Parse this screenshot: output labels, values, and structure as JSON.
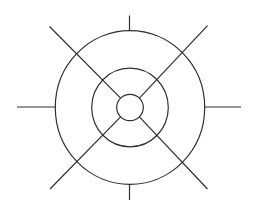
{
  "diagram": {
    "type": "concentric-target",
    "background": "#ffffff",
    "stroke_color": "#2f2f2f",
    "center": {
      "x": 130,
      "y": 107.5
    },
    "rings": [
      {
        "name": "inner",
        "rx": 13.3,
        "ry": 13.2
      },
      {
        "name": "middle",
        "rx": 38.3,
        "ry": 39.3
      },
      {
        "name": "outer",
        "rx": 74.7,
        "ry": 76.8
      }
    ],
    "cardinal_ticks": [
      {
        "name": "top",
        "x1": 129.5,
        "y1": 15.5,
        "x2": 129.5,
        "y2": 30.8
      },
      {
        "name": "bottom",
        "x1": 129.5,
        "y1": 184.3,
        "x2": 129.5,
        "y2": 200
      },
      {
        "name": "left",
        "x1": 17,
        "y1": 107,
        "x2": 55.2,
        "y2": 107
      },
      {
        "name": "right",
        "x1": 204.5,
        "y1": 107,
        "x2": 241,
        "y2": 107
      }
    ],
    "diagonals": [
      {
        "name": "top-left",
        "x1": 49.5,
        "y1": 26.5,
        "x2": 120.6,
        "y2": 98.2
      },
      {
        "name": "top-right",
        "x1": 207.5,
        "y1": 25.7,
        "x2": 139.4,
        "y2": 98.2
      },
      {
        "name": "bottom-left",
        "x1": 50,
        "y1": 189,
        "x2": 120.6,
        "y2": 116.8
      },
      {
        "name": "bottom-right",
        "x1": 207.5,
        "y1": 189,
        "x2": 139.4,
        "y2": 116.8
      }
    ]
  }
}
